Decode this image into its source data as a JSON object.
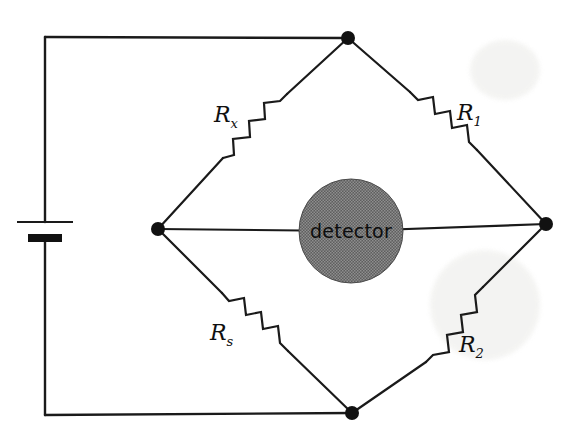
{
  "figure": {
    "background_color": "#ffffff",
    "wire_color": "#1a1a1a",
    "node_color": "#111111",
    "detector_fill_color": "#6a6a6a"
  },
  "detector": {
    "label": "detector",
    "shape": "circle",
    "center_x": 351,
    "center_y": 231,
    "radius": 52
  },
  "resistors": [
    {
      "id": "rx",
      "label_main": "R",
      "label_sub": "x",
      "position": "upper-left",
      "label_x": 214,
      "label_y": 122
    },
    {
      "id": "r1",
      "label_main": "R",
      "label_sub": "1",
      "position": "upper-right",
      "label_x": 457,
      "label_y": 120
    },
    {
      "id": "rs",
      "label_main": "R",
      "label_sub": "s",
      "position": "lower-left",
      "label_x": 210,
      "label_y": 340
    },
    {
      "id": "r2",
      "label_main": "R",
      "label_sub": "2",
      "position": "lower-right",
      "label_x": 459,
      "label_y": 352
    }
  ],
  "nodes": [
    {
      "id": "top",
      "x": 348,
      "y": 38,
      "r": 7
    },
    {
      "id": "left",
      "x": 158,
      "y": 229,
      "r": 7
    },
    {
      "id": "right",
      "x": 546,
      "y": 224,
      "r": 7
    },
    {
      "id": "bottom",
      "x": 352,
      "y": 413,
      "r": 7
    }
  ],
  "battery": {
    "name": "battery",
    "x": 45,
    "long_plate_y": 222,
    "long_plate_half_width": 28,
    "short_plate_y": 238,
    "short_plate_half_width": 17
  },
  "wires": {
    "top_left_corner_x": 45,
    "top_left_corner_y": 37,
    "bottom_left_corner_x": 45,
    "bottom_left_corner_y": 415
  }
}
